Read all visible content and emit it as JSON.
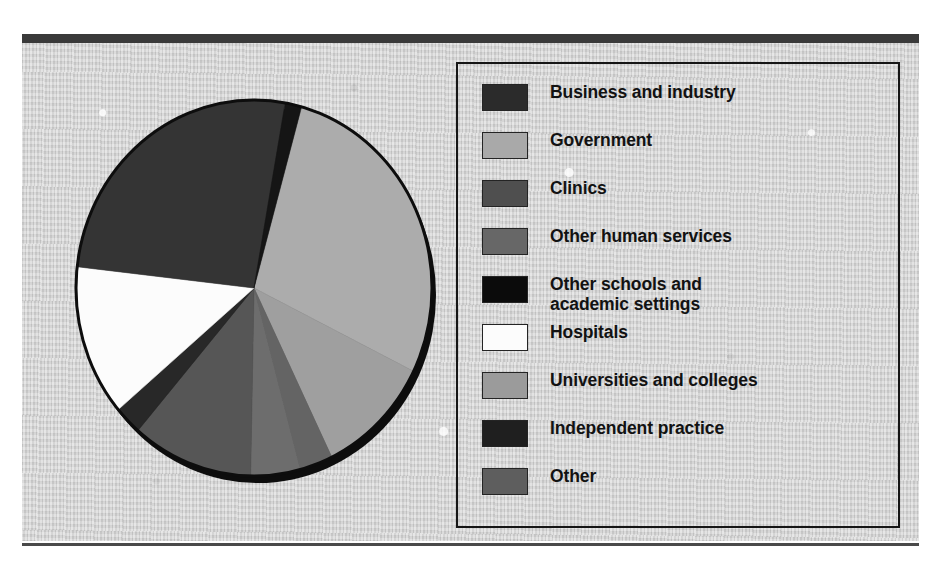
{
  "figure": {
    "title": "",
    "background_color": "#d3d3d3",
    "frame_color": "#3a3a3a",
    "legend_border_color": "#151515"
  },
  "legend": {
    "items": [
      {
        "label": "Business and industry",
        "color": "#2b2b2b"
      },
      {
        "label": "Government",
        "color": "#a9a9a9"
      },
      {
        "label": "Clinics",
        "color": "#4f4f4f"
      },
      {
        "label": "Other human services",
        "color": "#676767"
      },
      {
        "label": "Other schools and\nacademic settings",
        "color": "#0b0b0b"
      },
      {
        "label": "Hospitals",
        "color": "#fcfcfc"
      },
      {
        "label": "Universities and colleges",
        "color": "#9b9b9b"
      },
      {
        "label": "Independent practice",
        "color": "#1f1f1f"
      },
      {
        "label": "Other",
        "color": "#5e5e5e"
      }
    ]
  },
  "chart_data": {
    "type": "pie",
    "title": "",
    "xlabel": "",
    "ylabel": "",
    "legend_position": "right",
    "grid": false,
    "start_angle_deg": 15.5,
    "direction": "clockwise",
    "categories": [
      "Government",
      "Universities and colleges",
      "Other",
      "Other human services",
      "Clinics",
      "Independent practice",
      "Hospitals",
      "Business and industry",
      "Other schools and academic settings"
    ],
    "values": [
      28.0,
      10.5,
      3.0,
      4.5,
      11.0,
      2.5,
      13.0,
      26.0,
      1.5
    ],
    "colors": [
      "#a9a9a9",
      "#9b9b9b",
      "#5e5e5e",
      "#676767",
      "#4f4f4f",
      "#1f1f1f",
      "#fcfcfc",
      "#2b2b2b",
      "#0b0b0b"
    ],
    "units": "percent"
  }
}
